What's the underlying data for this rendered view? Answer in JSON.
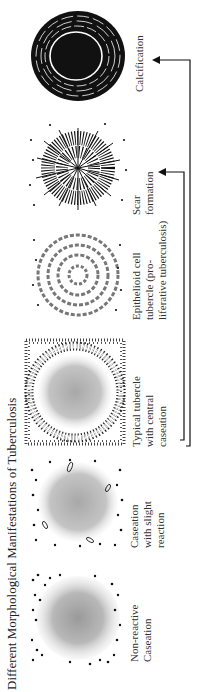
{
  "diagram": {
    "title": "Different Morphological Manifestations of Tuberculosis",
    "orientation": "rotated 90° counter-clockwise",
    "stages": [
      {
        "id": "non-reactive-caseation",
        "label_lines": [
          "Non-reactive",
          "Caseation"
        ]
      },
      {
        "id": "caseation-slight-reaction",
        "label_lines": [
          "Caseation",
          "with slight",
          "reaction"
        ]
      },
      {
        "id": "typical-tubercle",
        "label_lines": [
          "Typical tubercle",
          "with central",
          "caseation"
        ]
      },
      {
        "id": "epithelioid-cell-tubercle",
        "label_lines": [
          "Epithelioid cell",
          "tubercle (pro-",
          "liferative tuberculosis)"
        ]
      },
      {
        "id": "scar-formation",
        "label_lines": [
          "Scar",
          "formation"
        ]
      },
      {
        "id": "calcification",
        "label_lines": [
          "Calcification"
        ]
      }
    ],
    "arrows": [
      {
        "from": "typical-tubercle",
        "to": "scar-formation"
      },
      {
        "from": "typical-tubercle",
        "to": "calcification"
      }
    ]
  }
}
